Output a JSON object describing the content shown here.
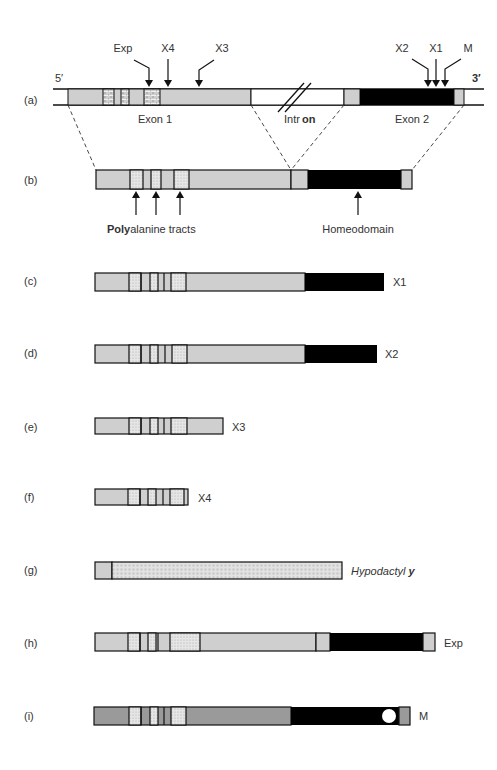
{
  "figure": {
    "colors": {
      "exon_light": "#cfcfcf",
      "exon_mid": "#9a9a9a",
      "homeodomain": "#000000",
      "outline": "#1a1a1a",
      "tract_fill": "#e3e3e3",
      "intron": "#ffffff",
      "hypodactyly_fill": "#e8e8e8"
    },
    "gene": {
      "label": "(a)",
      "five_prime": "5′",
      "three_prime": "3′",
      "exon1_label": "Exon 1",
      "intron_label_a": "Intr",
      "intron_label_b": "on",
      "exon2_label": "Exon 2",
      "mutation_markers": [
        {
          "name": "Exp"
        },
        {
          "name": "X4"
        },
        {
          "name": "X3"
        },
        {
          "name": "X2"
        },
        {
          "name": "X1"
        },
        {
          "name": "M"
        }
      ]
    },
    "protein": {
      "label": "(b)",
      "polyalanine_bold": "Poly",
      "polyalanine_rest": "alanine tracts",
      "homeodomain_label": "Homeodomain"
    },
    "variants": [
      {
        "row": "(c)",
        "name": "X1"
      },
      {
        "row": "(d)",
        "name": "X2"
      },
      {
        "row": "(e)",
        "name": "X3"
      },
      {
        "row": "(f)",
        "name": "X4"
      },
      {
        "row": "(g)",
        "name_a": "Hypodactyl",
        "name_b": "y"
      },
      {
        "row": "(h)",
        "name": "Exp"
      },
      {
        "row": "(i)",
        "name": "M"
      }
    ]
  }
}
